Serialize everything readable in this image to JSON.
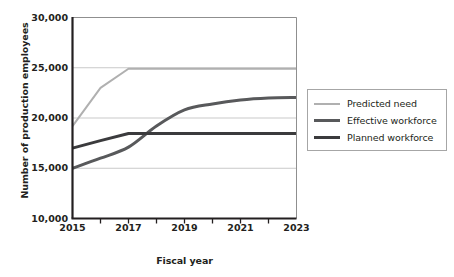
{
  "chart_data": {
    "type": "line",
    "title": "",
    "xlabel": "Fiscal year",
    "ylabel": "Number of production employees",
    "xlim": [
      2015,
      2023
    ],
    "ylim": [
      10000,
      30000
    ],
    "grid": true,
    "legend_position": "right",
    "x": [
      2015,
      2016,
      2017,
      2018,
      2019,
      2020,
      2021,
      2022,
      2023
    ],
    "xticks_major": [
      "2015",
      "2017",
      "2019",
      "2021",
      "2023"
    ],
    "xticks_minor": [
      "2016",
      "2018",
      "2020",
      "2022"
    ],
    "yticks": [
      "10,000",
      "15,000",
      "20,000",
      "25,000",
      "30,000"
    ],
    "ytick_values": [
      10000,
      15000,
      20000,
      25000,
      30000
    ],
    "series": [
      {
        "name": "Predicted need",
        "color": "#b0b0b0",
        "width": 2.0,
        "values": [
          19200,
          23000,
          24900,
          24900,
          24900,
          24900,
          24900,
          24900,
          24900
        ]
      },
      {
        "name": "Effective workforce",
        "color": "#58595b",
        "width": 3.0,
        "values": [
          15000,
          16000,
          17100,
          19200,
          20800,
          21400,
          21800,
          22000,
          22050
        ]
      },
      {
        "name": "Planned workforce",
        "color": "#3b3b3d",
        "width": 3.0,
        "values": [
          17000,
          17750,
          18450,
          18450,
          18450,
          18450,
          18450,
          18450,
          18450
        ]
      }
    ]
  },
  "axes": {
    "frame_color": "#231f20",
    "grid_color": "#c9c9c9"
  },
  "legend": {
    "border_color": "#a6a6a6",
    "items": [
      {
        "label": "Predicted need",
        "color": "#b0b0b0",
        "thickness": "2px"
      },
      {
        "label": "Effective workforce",
        "color": "#58595b",
        "thickness": "3px"
      },
      {
        "label": "Planned workforce",
        "color": "#3b3b3d",
        "thickness": "3px"
      }
    ]
  }
}
